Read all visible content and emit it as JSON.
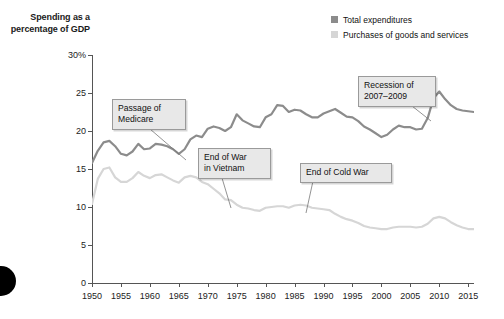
{
  "axis_title": "Spending as\na percentage\nof GDP",
  "legend": {
    "items": [
      {
        "label": "Total expenditures",
        "color": "#8c8c8c"
      },
      {
        "label": "Purchases of goods and services",
        "color": "#d6d6d6"
      }
    ]
  },
  "annotations": [
    {
      "name": "passage-of-medicare",
      "text": "Passage of\nMedicare",
      "x": 112,
      "y": 99,
      "w": 62,
      "lx1": 150,
      "ly1": 129,
      "lx2": 186,
      "ly2": 160
    },
    {
      "name": "end-of-war-in-vietnam",
      "text": "End of War\nin Vietnam",
      "x": 198,
      "y": 148,
      "w": 61,
      "lx1": 222,
      "ly1": 178,
      "lx2": 231,
      "ly2": 208
    },
    {
      "name": "end-of-cold-war",
      "text": "End of Cold War",
      "x": 300,
      "y": 163,
      "w": 80,
      "lx1": 313,
      "ly1": 181,
      "lx2": 306,
      "ly2": 213
    },
    {
      "name": "recession-of-2007-2009",
      "text": "Recession of\n2007–2009",
      "x": 358,
      "y": 76,
      "w": 66,
      "lx1": 412,
      "ly1": 106,
      "lx2": 431,
      "ly2": 121
    }
  ],
  "chart_data": {
    "type": "line",
    "title": "",
    "subtitle": "",
    "xlabel": "",
    "ylabel": "Spending as a percentage of GDP",
    "xlim": [
      1950,
      2016
    ],
    "ylim": [
      0,
      30
    ],
    "ytick_labels": [
      "0",
      "5",
      "10",
      "15",
      "20",
      "25",
      "30%"
    ],
    "ytick_values": [
      0,
      5,
      10,
      15,
      20,
      25,
      30
    ],
    "xtick_values": [
      1950,
      1955,
      1960,
      1965,
      1970,
      1975,
      1980,
      1985,
      1990,
      1995,
      2000,
      2005,
      2010,
      2015
    ],
    "xtick_labels": [
      "1950",
      "1955",
      "1960",
      "1965",
      "1970",
      "1975",
      "1980",
      "1985",
      "1990",
      "1995",
      "2000",
      "2005",
      "2010",
      "2015"
    ],
    "grid": false,
    "legend_position": "top-right",
    "x": [
      1950,
      1951,
      1952,
      1953,
      1954,
      1955,
      1956,
      1957,
      1958,
      1959,
      1960,
      1961,
      1962,
      1963,
      1964,
      1965,
      1966,
      1967,
      1968,
      1969,
      1970,
      1971,
      1972,
      1973,
      1974,
      1975,
      1976,
      1977,
      1978,
      1979,
      1980,
      1981,
      1982,
      1983,
      1984,
      1985,
      1986,
      1987,
      1988,
      1989,
      1990,
      1991,
      1992,
      1993,
      1994,
      1995,
      1996,
      1997,
      1998,
      1999,
      2000,
      2001,
      2002,
      2003,
      2004,
      2005,
      2006,
      2007,
      2008,
      2009,
      2010,
      2011,
      2012,
      2013,
      2014,
      2015,
      2016
    ],
    "series": [
      {
        "name": "Total expenditures",
        "color": "#8c8c8c",
        "values": [
          15.8,
          17.4,
          18.5,
          18.7,
          18.0,
          17.0,
          16.8,
          17.3,
          18.3,
          17.6,
          17.7,
          18.3,
          18.2,
          18.0,
          17.6,
          17.0,
          17.6,
          18.9,
          19.4,
          19.2,
          20.3,
          20.6,
          20.4,
          20.0,
          20.5,
          22.2,
          21.4,
          21.0,
          20.6,
          20.5,
          21.8,
          22.2,
          23.4,
          23.3,
          22.5,
          22.8,
          22.7,
          22.2,
          21.8,
          21.8,
          22.3,
          22.6,
          22.9,
          22.4,
          21.9,
          21.8,
          21.3,
          20.6,
          20.2,
          19.7,
          19.2,
          19.5,
          20.2,
          20.7,
          20.5,
          20.5,
          20.2,
          20.3,
          21.7,
          24.3,
          25.2,
          24.2,
          23.4,
          22.9,
          22.7,
          22.6,
          22.5
        ]
      },
      {
        "name": "Purchases of goods and services",
        "color": "#d6d6d6",
        "values": [
          10.4,
          13.7,
          15.0,
          15.2,
          13.9,
          13.3,
          13.3,
          13.8,
          14.6,
          14.1,
          13.8,
          14.2,
          14.3,
          13.9,
          13.5,
          13.2,
          13.9,
          14.1,
          13.9,
          13.3,
          13.0,
          12.4,
          11.8,
          11.0,
          10.9,
          10.3,
          9.9,
          9.8,
          9.6,
          9.5,
          9.9,
          10.0,
          10.1,
          10.1,
          9.9,
          10.2,
          10.3,
          10.2,
          9.9,
          9.8,
          9.7,
          9.6,
          9.1,
          8.7,
          8.4,
          8.2,
          7.9,
          7.5,
          7.3,
          7.2,
          7.1,
          7.1,
          7.3,
          7.4,
          7.4,
          7.4,
          7.3,
          7.4,
          7.8,
          8.5,
          8.7,
          8.5,
          8.0,
          7.6,
          7.3,
          7.1,
          7.1
        ]
      }
    ]
  }
}
